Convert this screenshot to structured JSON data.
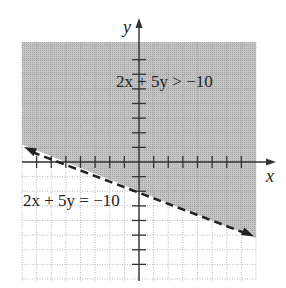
{
  "chart_data": {
    "type": "inequality-graph",
    "title": "",
    "xlabel": "x",
    "ylabel": "y",
    "xlim": [
      -8,
      8
    ],
    "ylim": [
      -8,
      8
    ],
    "grid": true,
    "grid_style": "dotted",
    "tick_interval": 1,
    "boundary_line": {
      "equation": "2x + 5y = -10",
      "slope": -0.4,
      "y_intercept": -2,
      "style": "dashed",
      "endpoints": [
        [
          -8,
          1.2
        ],
        [
          8,
          -5.2
        ]
      ],
      "arrows": "both"
    },
    "inequality": "2x + 5y > -10",
    "shaded_region": "above the line",
    "shade_color": "#bdbdbd",
    "annotations": [
      {
        "text": "2x + 5y > -10",
        "position": [
          0,
          5
        ]
      },
      {
        "text": "2x + 5y = -10",
        "position": [
          -4,
          -2
        ]
      }
    ]
  },
  "labels": {
    "x_axis": "x",
    "y_axis": "y",
    "inequality_label": "2x + 5y > −10",
    "equation_label": "2x + 5y = −10"
  }
}
